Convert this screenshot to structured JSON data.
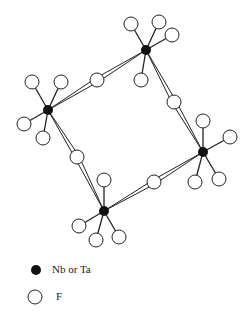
{
  "diagram": {
    "title": "",
    "metals": [
      {
        "id": "M1",
        "x": 146,
        "y": 50
      },
      {
        "id": "M2",
        "x": 48,
        "y": 110
      },
      {
        "id": "M3",
        "x": 203,
        "y": 152
      },
      {
        "id": "M4",
        "x": 104,
        "y": 211
      }
    ],
    "bridging_fluorines": [
      {
        "x": 97,
        "y": 80,
        "between": [
          "M1",
          "M2"
        ]
      },
      {
        "x": 174,
        "y": 102,
        "between": [
          "M1",
          "M3"
        ]
      },
      {
        "x": 77,
        "y": 157,
        "between": [
          "M2",
          "M4"
        ]
      },
      {
        "x": 154,
        "y": 182,
        "between": [
          "M3",
          "M4"
        ]
      }
    ],
    "terminal_fluorines": [
      {
        "x": 131,
        "y": 24,
        "metal": "M1"
      },
      {
        "x": 159,
        "y": 22,
        "metal": "M1"
      },
      {
        "x": 172,
        "y": 35,
        "metal": "M1"
      },
      {
        "x": 141,
        "y": 80,
        "metal": "M1"
      },
      {
        "x": 32,
        "y": 82,
        "metal": "M2"
      },
      {
        "x": 61,
        "y": 82,
        "metal": "M2"
      },
      {
        "x": 24,
        "y": 124,
        "metal": "M2"
      },
      {
        "x": 43,
        "y": 138,
        "metal": "M2"
      },
      {
        "x": 203,
        "y": 121,
        "metal": "M3"
      },
      {
        "x": 230,
        "y": 137,
        "metal": "M3"
      },
      {
        "x": 195,
        "y": 182,
        "metal": "M3"
      },
      {
        "x": 219,
        "y": 179,
        "metal": "M3"
      },
      {
        "x": 104,
        "y": 180,
        "metal": "M4"
      },
      {
        "x": 79,
        "y": 226,
        "metal": "M4"
      },
      {
        "x": 96,
        "y": 240,
        "metal": "M4"
      },
      {
        "x": 119,
        "y": 237,
        "metal": "M4"
      }
    ],
    "colors": {
      "metal": "#111111",
      "fluorine_stroke": "#222222",
      "fluorine_fill": "#ffffff",
      "bond": "#222222"
    }
  },
  "legend": {
    "items": [
      {
        "symbol": "filled-circle",
        "label": "Nb or Ta"
      },
      {
        "symbol": "open-circle",
        "label": "F"
      }
    ]
  }
}
